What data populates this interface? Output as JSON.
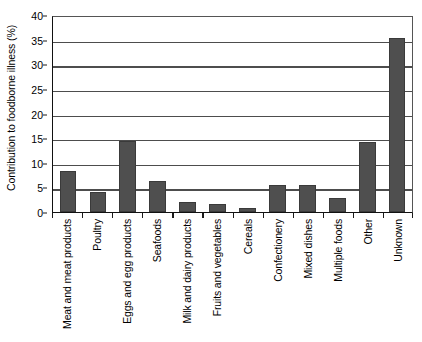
{
  "chart_data": {
    "type": "bar",
    "title": "",
    "xlabel": "",
    "ylabel": "Contribution to foodborne illness (%)",
    "ylim": [
      0,
      40
    ],
    "ytick_values": [
      0,
      5,
      10,
      15,
      20,
      25,
      30,
      35,
      40
    ],
    "ytick_labels": [
      "0",
      "5",
      "10",
      "15",
      "20",
      "25",
      "30",
      "35",
      "40"
    ],
    "grid": "horizontal",
    "legend": "none",
    "bar_color": "#4f4f4f",
    "categories": [
      "Meat and meat products",
      "Poultry",
      "Eggs and egg products",
      "Seafoods",
      "Milk and dairy products",
      "Fruits and vegetables",
      "Cereals",
      "Confectionery",
      "Mixed dishes",
      "Multiple foods",
      "Other",
      "Unknown"
    ],
    "values": [
      8.3,
      4.1,
      14.4,
      6.2,
      2.1,
      1.7,
      0.8,
      5.4,
      5.4,
      2.8,
      14.2,
      35.3
    ]
  }
}
